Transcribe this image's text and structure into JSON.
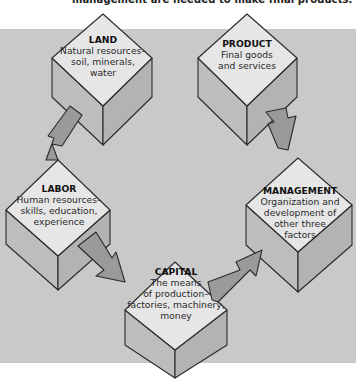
{
  "caption": {
    "text": "management are needed to make final products.",
    "page_marker": "21"
  },
  "colors": {
    "background": "#c9c9c9",
    "cube_top": "#e6e6e6",
    "cube_side": "#bdbdbd",
    "arrow": "#9a9a9a",
    "outline": "#2a2a2a"
  },
  "factors": [
    {
      "id": "land",
      "title": "LAND",
      "description": "Natural resources–\nsoil, minerals,\nwater"
    },
    {
      "id": "labor",
      "title": "LABOR",
      "description": "Human resources–\nskills, education,\nexperience"
    },
    {
      "id": "capital",
      "title": "CAPITAL",
      "description": "The means\nof production–\nfactories, machinery,\nmoney"
    },
    {
      "id": "management",
      "title": "MANAGEMENT",
      "description": "Organization and\ndevelopment of\nother three\nfactors"
    },
    {
      "id": "product",
      "title": "PRODUCT",
      "description": "Final goods\nand services"
    }
  ],
  "flow": [
    "land → labor",
    "labor → capital",
    "capital → management",
    "management → product"
  ]
}
